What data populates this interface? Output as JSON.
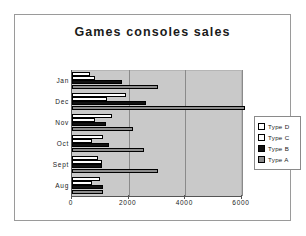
{
  "chart_data": {
    "type": "bar",
    "orientation": "horizontal",
    "title": "Games consoles sales",
    "xlabel": "",
    "ylabel": "",
    "categories": [
      "Aug",
      "Sept",
      "Oct",
      "Nov",
      "Dec",
      "Jan"
    ],
    "categories_top_to_bottom": [
      "Jan",
      "Dec",
      "Nov",
      "Oct",
      "Sept",
      "Aug"
    ],
    "series": [
      {
        "name": "Type D",
        "color": "#ffffff",
        "values": [
          1000,
          900,
          1100,
          1400,
          1900,
          650
        ]
      },
      {
        "name": "Type C",
        "color": "#fdfdfd",
        "values": [
          700,
          1050,
          700,
          800,
          1250,
          800
        ]
      },
      {
        "name": "Type B",
        "color": "#111111",
        "values": [
          1100,
          1050,
          1300,
          1200,
          2600,
          1750
        ]
      },
      {
        "name": "Type A",
        "color": "#8d8d8d",
        "values": [
          1100,
          3050,
          2550,
          2150,
          6100,
          3050
        ]
      }
    ],
    "xticks": [
      0,
      2000,
      4000,
      6000
    ],
    "xlim": [
      0,
      6000
    ],
    "grid": true,
    "legend_position": "right",
    "legend_entries": [
      "Type D",
      "Type C",
      "Type B",
      "Type A"
    ],
    "plot_background": "#c9c9c9"
  }
}
